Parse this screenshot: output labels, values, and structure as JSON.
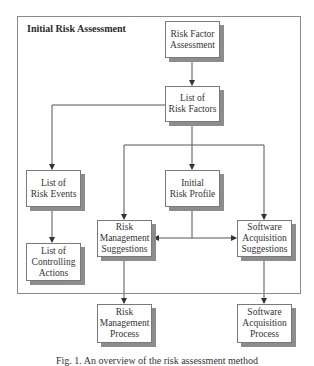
{
  "container": {
    "title": "Initial Risk Assessment"
  },
  "nodes": {
    "risk_factor_assessment": {
      "lines": [
        "Risk Factor",
        "Assessment"
      ]
    },
    "list_risk_factors": {
      "lines": [
        "List of",
        "Risk Factors"
      ]
    },
    "list_risk_events": {
      "lines": [
        "List of",
        "Risk Events"
      ]
    },
    "initial_risk_profile": {
      "lines": [
        "Initial",
        "Risk Profile"
      ]
    },
    "list_controlling_actions": {
      "lines": [
        "List of",
        "Controlling",
        "Actions"
      ]
    },
    "risk_mgmt_suggestions": {
      "lines": [
        "Risk",
        "Management",
        "Suggestions"
      ]
    },
    "software_acq_suggestions": {
      "lines": [
        "Software",
        "Acquisition",
        "Suggestions"
      ]
    },
    "risk_mgmt_process": {
      "lines": [
        "Risk",
        "Management",
        "Process"
      ]
    },
    "software_acq_process": {
      "lines": [
        "Software",
        "Acquisition",
        "Process"
      ]
    }
  },
  "edges": [
    {
      "from": "Risk Factor Assessment",
      "to": "List of Risk Factors"
    },
    {
      "from": "List of Risk Factors",
      "to": "List of Risk Events"
    },
    {
      "from": "List of Risk Factors",
      "to": "Initial Risk Profile"
    },
    {
      "from": "List of Risk Factors",
      "to": "Risk Management Suggestions"
    },
    {
      "from": "List of Risk Factors",
      "to": "Software Acquisition Suggestions"
    },
    {
      "from": "List of Risk Events",
      "to": "List of Controlling Actions"
    },
    {
      "from": "Initial Risk Profile",
      "to": "Risk Management Suggestions"
    },
    {
      "from": "Initial Risk Profile",
      "to": "Software Acquisition Suggestions"
    },
    {
      "from": "Risk Management Suggestions",
      "to": "Risk Management Process"
    },
    {
      "from": "Software Acquisition Suggestions",
      "to": "Software Acquisition Process"
    }
  ],
  "caption": "Fig. 1.  An overview of the risk assessment method"
}
